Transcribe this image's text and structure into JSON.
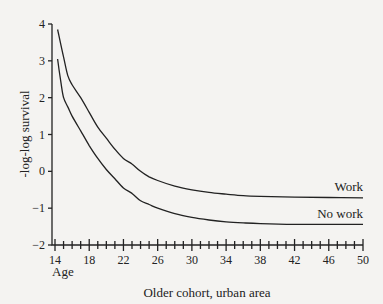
{
  "chart_data": {
    "type": "line",
    "title": "",
    "caption": "Older cohort, urban area",
    "xlabel": "Age",
    "ylabel": "-log-log survival",
    "xlim": [
      14,
      50
    ],
    "ylim": [
      -2,
      4
    ],
    "x_ticks": [
      14,
      18,
      22,
      26,
      30,
      34,
      38,
      42,
      46,
      50
    ],
    "x_minor_step": 1,
    "y_ticks": [
      4,
      3,
      2,
      1,
      0,
      -1,
      -2
    ],
    "y_tick_labels": [
      "4",
      "3",
      "2",
      "1",
      "0",
      "−1",
      "−2"
    ],
    "grid": false,
    "legend": "inline labels at right end of curves",
    "series": [
      {
        "name": "Work",
        "x": [
          14.3,
          15,
          15.5,
          16,
          17,
          18,
          19,
          20,
          21,
          22,
          23,
          24,
          25,
          26,
          28,
          30,
          32,
          34,
          36,
          38,
          42,
          46,
          50
        ],
        "y": [
          3.85,
          3.1,
          2.6,
          2.35,
          2.0,
          1.6,
          1.2,
          0.9,
          0.6,
          0.35,
          0.2,
          0.0,
          -0.15,
          -0.25,
          -0.4,
          -0.5,
          -0.57,
          -0.62,
          -0.66,
          -0.68,
          -0.7,
          -0.71,
          -0.72
        ]
      },
      {
        "name": "No work",
        "x": [
          14.3,
          14.7,
          15,
          15.5,
          16,
          17,
          18,
          19,
          20,
          21,
          22,
          23,
          24,
          25,
          26,
          28,
          30,
          32,
          34,
          36,
          38,
          42,
          46,
          50
        ],
        "y": [
          3.05,
          2.4,
          2.0,
          1.75,
          1.5,
          1.1,
          0.7,
          0.35,
          0.05,
          -0.2,
          -0.45,
          -0.6,
          -0.8,
          -0.9,
          -1.0,
          -1.15,
          -1.25,
          -1.32,
          -1.37,
          -1.4,
          -1.42,
          -1.44,
          -1.44,
          -1.44
        ]
      }
    ]
  }
}
